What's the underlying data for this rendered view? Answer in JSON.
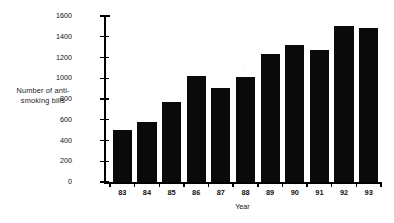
{
  "chart_data": {
    "type": "bar",
    "title": "",
    "xlabel": "Year",
    "ylabel": "Number of anti-smoking bills",
    "ylabel_lines": [
      "Number of anti-",
      "smoking bills"
    ],
    "categories": [
      "83",
      "84",
      "85",
      "86",
      "87",
      "88",
      "89",
      "90",
      "91",
      "92",
      "93"
    ],
    "values": [
      505,
      575,
      775,
      1020,
      905,
      1015,
      1235,
      1325,
      1270,
      1500,
      1485
    ],
    "ylim": [
      0,
      1600
    ],
    "ytick_step": 200,
    "yticks": [
      0,
      200,
      400,
      600,
      800,
      1000,
      1200,
      1400,
      1600
    ],
    "ytick_labels": [
      "0",
      "200",
      "400",
      "600",
      "800",
      "1000",
      "1200",
      "1400",
      "1600"
    ],
    "grid": false,
    "legend": false,
    "legend_position": "none",
    "bar_color": "#0a0a0a",
    "background_color": "#ffffff",
    "axis_color": "#000000"
  }
}
